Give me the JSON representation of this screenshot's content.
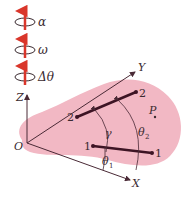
{
  "diagram": {
    "legend": [
      {
        "symbol": "α",
        "name": "angular-acceleration"
      },
      {
        "symbol": "ω",
        "name": "angular-velocity"
      },
      {
        "symbol": "Δθ",
        "name": "angular-displacement"
      }
    ],
    "axes": {
      "x": "X",
      "y": "Y",
      "z": "Z",
      "origin": "O"
    },
    "bars": [
      {
        "label_start": "2",
        "label_end": "2"
      },
      {
        "label_start": "1",
        "label_end": "1"
      }
    ],
    "angles": {
      "gamma": "γ",
      "theta1": "θ",
      "theta1_sub": "1",
      "theta2": "θ",
      "theta2_sub": "2"
    },
    "point": "P",
    "colors": {
      "body": "#f2b8c4",
      "arrow": "#d9362b",
      "bar": "#3d1424",
      "line": "#4a2a36"
    }
  }
}
